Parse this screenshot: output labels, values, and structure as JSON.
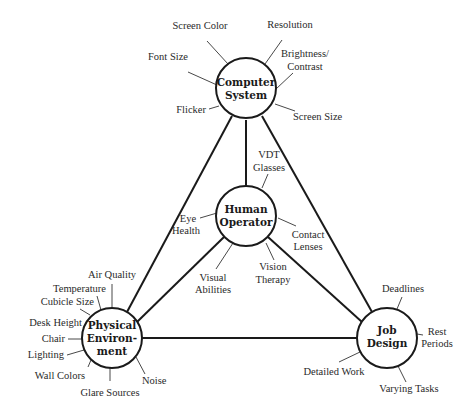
{
  "diagram": {
    "type": "hub-and-spoke triangle",
    "colors": {
      "stroke": "#1a1a1a",
      "background": "#ffffff",
      "text": "#2a2a2a"
    },
    "hubs": {
      "computer_system": {
        "lines": [
          "Computer",
          "System"
        ]
      },
      "human_operator": {
        "lines": [
          "Human",
          "Operator"
        ]
      },
      "physical_environment": {
        "lines": [
          "Physical",
          "Environ-",
          "ment"
        ]
      },
      "job_design": {
        "lines": [
          "Job",
          "Design"
        ]
      }
    },
    "factors": {
      "computer_system": {
        "screen_color": "Screen Color",
        "resolution": "Resolution",
        "font_size": "Font Size",
        "brightness_contrast": [
          "Brightness/",
          "Contrast"
        ],
        "flicker": "Flicker",
        "screen_size": "Screen Size"
      },
      "human_operator": {
        "vdt_glasses": [
          "VDT",
          "Glasses"
        ],
        "eye_health": [
          "Eye",
          "Health"
        ],
        "contact_lenses": [
          "Contact",
          "Lenses"
        ],
        "visual_abilities": [
          "Visual",
          "Abilities"
        ],
        "vision_therapy": [
          "Vision",
          "Therapy"
        ]
      },
      "physical_environment": {
        "air_quality": "Air Quality",
        "temperature": "Temperature",
        "cubicle_size": "Cubicle Size",
        "desk_height": "Desk Height",
        "chair": "Chair",
        "lighting": "Lighting",
        "wall_colors": "Wall Colors",
        "glare_sources": "Glare Sources",
        "noise": "Noise"
      },
      "job_design": {
        "deadlines": "Deadlines",
        "rest_periods": [
          "Rest",
          "Periods"
        ],
        "detailed_work": "Detailed Work",
        "varying_tasks": "Varying Tasks"
      }
    },
    "connections": [
      [
        "Computer System",
        "Human Operator"
      ],
      [
        "Computer System",
        "Physical Environment"
      ],
      [
        "Computer System",
        "Job Design"
      ],
      [
        "Human Operator",
        "Physical Environment"
      ],
      [
        "Human Operator",
        "Job Design"
      ],
      [
        "Physical Environment",
        "Job Design"
      ]
    ]
  }
}
